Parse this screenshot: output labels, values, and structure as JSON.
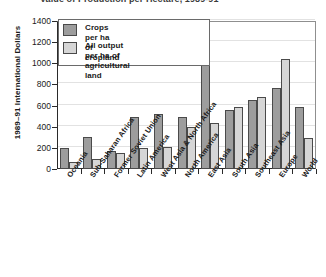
{
  "chart_data": {
    "type": "bar",
    "title": "Value of Production per Hectare, 1989-91",
    "xlabel": "",
    "ylabel": "1989–91 International Dollars",
    "ylim": [
      0,
      1400
    ],
    "ytick_step": 200,
    "ytick_labels": [
      "0",
      "200",
      "400",
      "600",
      "800",
      "1000",
      "1200",
      "1400"
    ],
    "grid": true,
    "legend_position": "top-left",
    "categories": [
      "Oceania",
      "Sub-Saharan Africa",
      "Former Soviet Union",
      "Latin America",
      "West Asia & North Africa",
      "North America",
      "East Asia",
      "South Asia",
      "Southeast Asia",
      "Europe",
      "World"
    ],
    "series": [
      {
        "name": "Crops per ha of cropland",
        "color": "#9d9d9d",
        "values": [
          200,
          300,
          175,
          490,
          520,
          490,
          1320,
          555,
          650,
          770,
          590
        ]
      },
      {
        "name": "All output per ha of agricultural land",
        "color": "#d6d6d6",
        "values": [
          65,
          95,
          150,
          195,
          210,
          395,
          440,
          590,
          680,
          1040,
          290
        ]
      }
    ]
  },
  "legend": {
    "entries": [
      "Crops per ha of cropland",
      "All output per ha of\nagricultural land"
    ]
  }
}
